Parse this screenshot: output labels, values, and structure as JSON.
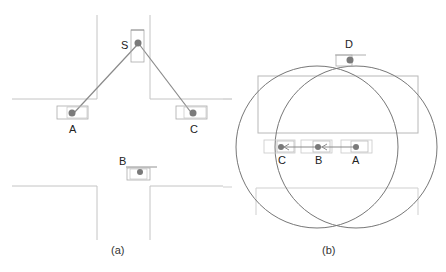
{
  "figure": {
    "panel_a": {
      "caption": "(a)",
      "nodes": [
        {
          "id": "S",
          "label": "S",
          "x": 126,
          "y": 44
        },
        {
          "id": "A",
          "label": "A",
          "x": 72,
          "y": 115
        },
        {
          "id": "C",
          "label": "C",
          "x": 193,
          "y": 115
        },
        {
          "id": "B",
          "label": "B",
          "x": 140,
          "y": 172
        }
      ],
      "links": [
        {
          "from": "S",
          "to": "A"
        },
        {
          "from": "S",
          "to": "C"
        }
      ]
    },
    "panel_b": {
      "caption": "(b)",
      "nodes": [
        {
          "id": "D",
          "label": "D",
          "x": 350,
          "y": 60
        },
        {
          "id": "C",
          "label": "C",
          "x": 281,
          "y": 147
        },
        {
          "id": "B",
          "label": "B",
          "x": 318,
          "y": 147
        },
        {
          "id": "A",
          "label": "A",
          "x": 356,
          "y": 147
        }
      ],
      "links": [
        {
          "from": "A",
          "to": "B",
          "arrow": true
        },
        {
          "from": "B",
          "to": "C",
          "arrow": true
        }
      ],
      "circles": [
        {
          "name": "range-left",
          "cx": 317,
          "cy": 147,
          "r": 81
        },
        {
          "name": "range-right",
          "cx": 356,
          "cy": 147,
          "r": 81
        }
      ]
    },
    "colors": {
      "road": "#b8b8b8",
      "link": "#8a8a8a",
      "node": "#7a7a7a",
      "circle": "#777777",
      "vehicle_box": "#aaaaaa"
    }
  }
}
